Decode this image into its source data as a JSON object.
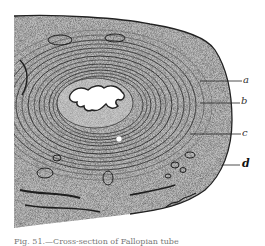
{
  "figure": {
    "labels": [
      {
        "id": "a",
        "text": "a"
      },
      {
        "id": "b",
        "text": "b"
      },
      {
        "id": "c",
        "text": "c"
      },
      {
        "id": "d",
        "text": "d"
      }
    ],
    "signature": "artist signature",
    "colors": {
      "ink": "#1a1a1a",
      "tissue_light": "#d8d8d8",
      "tissue_mid": "#8a8a8a",
      "paper": "#ffffff"
    }
  },
  "caption": "Fig. 51.—Cross-section of Fallopian tube"
}
